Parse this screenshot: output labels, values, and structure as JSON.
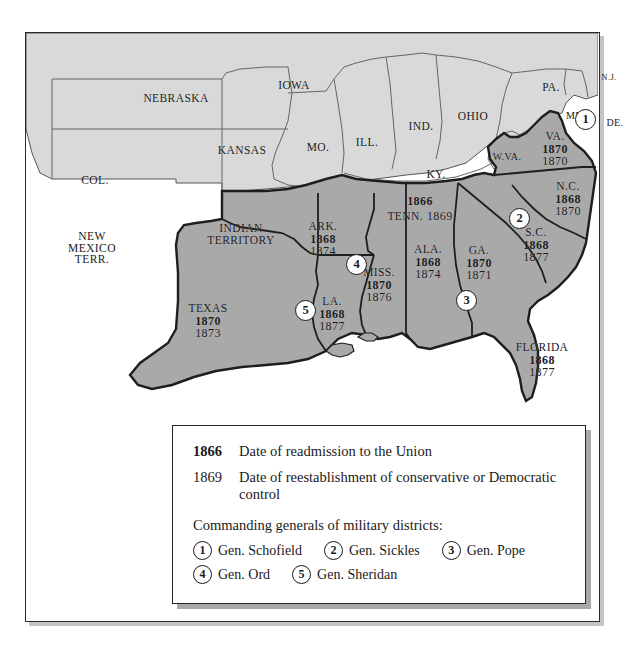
{
  "map": {
    "title": "Reconstruction of the South",
    "colors": {
      "confederate_fill": "#a9a9a9",
      "union_fill": "#d9d9d9",
      "water": "#ffffff",
      "border": "#2a2a2a",
      "frame": "#262626"
    },
    "union_states": [
      {
        "name": "NEBRASKA",
        "x": 150,
        "y": 66
      },
      {
        "name": "IOWA",
        "x": 268,
        "y": 53
      },
      {
        "name": "ILL.",
        "x": 341,
        "y": 110
      },
      {
        "name": "IND.",
        "x": 394,
        "y": 94
      },
      {
        "name": "OHIO",
        "x": 447,
        "y": 84
      },
      {
        "name": "PA.",
        "x": 525,
        "y": 55
      },
      {
        "name": "N.J.",
        "x": 583,
        "y": 46
      },
      {
        "name": "MD.",
        "x": 549,
        "y": 84
      },
      {
        "name": "DE.",
        "x": 589,
        "y": 91
      },
      {
        "name": "W.VA.",
        "x": 481,
        "y": 125
      },
      {
        "name": "KY.",
        "x": 410,
        "y": 142
      },
      {
        "name": "MO.",
        "x": 292,
        "y": 115
      },
      {
        "name": "KANSAS",
        "x": 216,
        "y": 118
      },
      {
        "name": "COL.",
        "x": 69,
        "y": 148
      },
      {
        "name": "NEW MEXICO TERR.",
        "x": 66,
        "y": 216,
        "lines": [
          "NEW",
          "MEXICO",
          "TERR."
        ]
      },
      {
        "name": "INDIAN TERRITORY",
        "x": 215,
        "y": 202,
        "lines": [
          "INDIAN",
          "TERRITORY"
        ]
      }
    ],
    "confederate_states": [
      {
        "abbr": "VA.",
        "readmission": "1870",
        "control": "1870",
        "x": 529,
        "y": 111
      },
      {
        "abbr": "N.C.",
        "readmission": "1868",
        "control": "1870",
        "x": 541,
        "y": 161
      },
      {
        "abbr": "S.C.",
        "readmission": "1868",
        "control": "1877",
        "x": 509,
        "y": 207
      },
      {
        "abbr": "GA.",
        "readmission": "1870",
        "control": "1871",
        "x": 452,
        "y": 225
      },
      {
        "abbr": "FLORIDA",
        "readmission": "1868",
        "control": "1877",
        "x": 516,
        "y": 322
      },
      {
        "abbr": "ALA.",
        "readmission": "1868",
        "control": "1874",
        "x": 401,
        "y": 224
      },
      {
        "abbr": "MISS.",
        "readmission": "1870",
        "control": "1876",
        "x": 352,
        "y": 247
      },
      {
        "abbr": "LA.",
        "readmission": "1868",
        "control": "1877",
        "x": 305,
        "y": 276
      },
      {
        "abbr": "ARK.",
        "readmission": "1868",
        "control": "1874",
        "x": 296,
        "y": 201
      },
      {
        "abbr": "TEXAS",
        "readmission": "1870",
        "control": "1873",
        "x": 181,
        "y": 283
      },
      {
        "abbr": "TENN.",
        "readmission": "1866",
        "control": "1869",
        "x": 390,
        "y": 175,
        "inline": true
      }
    ],
    "district_markers": [
      {
        "number": "1",
        "x": 560,
        "y": 86
      },
      {
        "number": "2",
        "x": 494,
        "y": 185
      },
      {
        "number": "3",
        "x": 441,
        "y": 267
      },
      {
        "number": "4",
        "x": 331,
        "y": 231
      },
      {
        "number": "5",
        "x": 280,
        "y": 277
      }
    ]
  },
  "legend": {
    "rows": [
      {
        "year": "1866",
        "bold": true,
        "text": "Date of readmission to the Union"
      },
      {
        "year": "1869",
        "bold": false,
        "text": "Date of reestablishment of conservative or Democratic control"
      }
    ],
    "generals_heading": "Commanding generals of military districts:",
    "generals": [
      {
        "number": "1",
        "name": "Gen. Schofield"
      },
      {
        "number": "2",
        "name": "Gen. Sickles"
      },
      {
        "number": "3",
        "name": "Gen. Pope"
      },
      {
        "number": "4",
        "name": "Gen. Ord"
      },
      {
        "number": "5",
        "name": "Gen. Sheridan"
      }
    ]
  }
}
